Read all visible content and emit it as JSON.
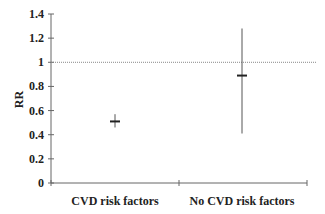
{
  "chart_data": {
    "type": "scatter",
    "subtype": "point-with-error-bars",
    "title": "",
    "xlabel": "",
    "ylabel": "RR",
    "categories": [
      "CVD risk factors",
      "No CVD risk factors"
    ],
    "series": [
      {
        "name": "RR",
        "values": [
          0.51,
          0.89
        ],
        "ci_lower": [
          0.46,
          0.41
        ],
        "ci_upper": [
          0.57,
          1.28
        ]
      }
    ],
    "ylim": [
      0,
      1.4
    ],
    "yticks": [
      "0",
      "0.2",
      "0.4",
      "0.6",
      "0.8",
      "1",
      "1.2",
      "1.4"
    ],
    "reference_line": {
      "y": 1,
      "style": "dotted"
    },
    "grid": false,
    "legend": null
  }
}
